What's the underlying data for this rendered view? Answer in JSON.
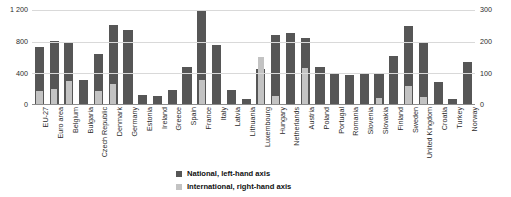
{
  "chart_data": {
    "type": "bar",
    "title": "",
    "xlabel": "",
    "ylabel": "",
    "grid": true,
    "legend_position": "bottom-center",
    "categories": [
      "EU-27",
      "Euro area",
      "Belgium",
      "Bulgaria",
      "Czech Republic",
      "Denmark",
      "Germany",
      "Estonia",
      "Ireland",
      "Greece",
      "Spain",
      "France",
      "Italy",
      "Latvia",
      "Lithuania",
      "Luxembourg",
      "Hungary",
      "Netherlands",
      "Austria",
      "Poland",
      "Portugal",
      "Romania",
      "Slovenia",
      "Slovakia",
      "Finland",
      "Sweden",
      "United Kingdom",
      "Croatia",
      "Turkey",
      "Norway"
    ],
    "left_axis": {
      "name": "National, left-hand axis",
      "ticks": [
        "0",
        "400",
        "800",
        "1 200"
      ],
      "tick_values": [
        0,
        400,
        800,
        1200
      ],
      "ylim": [
        0,
        1200
      ]
    },
    "right_axis": {
      "name": "International, right-hand axis",
      "ticks": [
        "0",
        "100",
        "200",
        "300"
      ],
      "tick_values": [
        0,
        100,
        200,
        300
      ],
      "ylim": [
        0,
        300
      ]
    },
    "series": [
      {
        "name": "National, left-hand axis",
        "axis": "left",
        "color": "#565656",
        "values": [
          730,
          810,
          785,
          310,
          645,
          1010,
          950,
          130,
          120,
          185,
          480,
          1190,
          760,
          190,
          75,
          450,
          880,
          910,
          850,
          475,
          390,
          385,
          390,
          400,
          620,
          1000,
          790,
          295,
          70,
          545
        ]
      },
      {
        "name": "International, right-hand axis",
        "axis": "right",
        "color": "#c3c3c3",
        "values": [
          45,
          52,
          76,
          0,
          44,
          66,
          0,
          0,
          0,
          0,
          0,
          78,
          0,
          0,
          0,
          152,
          28,
          0,
          118,
          0,
          0,
          0,
          0,
          22,
          0,
          60,
          26,
          0,
          0,
          0
        ]
      }
    ],
    "legend": [
      {
        "label": "National, left-hand axis",
        "color": "#565656"
      },
      {
        "label": "International, right-hand axis",
        "color": "#c3c3c3"
      }
    ]
  }
}
